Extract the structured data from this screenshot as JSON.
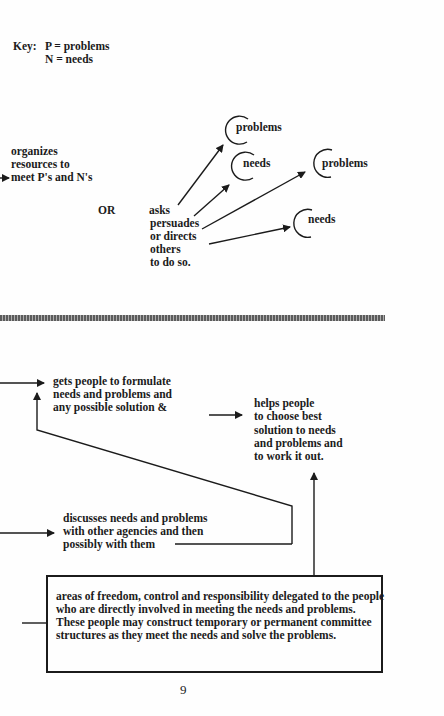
{
  "key": {
    "label": "Key:",
    "line1": "P = problems",
    "line2": "N = needs"
  },
  "upper": {
    "organizes": [
      "organizes",
      "resources to",
      "meet P's and N's"
    ],
    "or_label": "OR",
    "asks": [
      "asks",
      "persuades",
      "or directs",
      "others",
      "to do so."
    ],
    "circles": [
      {
        "label": "problems"
      },
      {
        "label": "needs"
      },
      {
        "label": "problems"
      },
      {
        "label": "needs"
      }
    ]
  },
  "lower": {
    "gets_people": [
      "gets people to formulate",
      "needs and problems and",
      "any possible solution &"
    ],
    "helps_people": [
      "helps people",
      "to choose best",
      "solution to needs",
      "and problems and",
      "to work it out."
    ],
    "discusses": [
      "discusses needs and problems",
      "with other agencies and then",
      "possibly with them"
    ],
    "box_text": "areas of freedom, control and responsibility delegated to the people who are directly involved in meeting the needs and problems. These people may construct temporary or permanent committee structures as they meet the needs and solve the problems."
  },
  "page_number": "9"
}
